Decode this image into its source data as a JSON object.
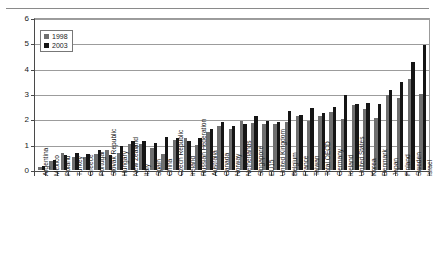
{
  "chart_data": {
    "type": "bar",
    "title": "",
    "xlabel": "",
    "ylabel": "",
    "ylim": [
      0,
      6
    ],
    "yticks": [
      0,
      1,
      2,
      3,
      4,
      5,
      6
    ],
    "grid": true,
    "legend_position": "top-left",
    "categories": [
      "Argentina",
      "Mexico",
      "Poland",
      "Turkey",
      "Greece",
      "Portugal",
      "Slovak Republic",
      "Hungary",
      "New Zealand",
      "Italy",
      "Spain",
      "China",
      "Czech Republic",
      "Ireland",
      "Russian Federation",
      "Australia",
      "Canada",
      "Norway",
      "Netherlands",
      "Singapore",
      "EU15",
      "United Kingdom",
      "Belgium",
      "France",
      "Taiwan",
      "Total OECD",
      "Germany",
      "Iceland",
      "United States",
      "Korea",
      "Denmark",
      "Japan",
      "Finland",
      "Sweden",
      "Israel"
    ],
    "series": [
      {
        "name": "1998",
        "color": "#6f6f6f",
        "values": [
          0.12,
          0.35,
          0.68,
          0.5,
          0.5,
          0.63,
          0.8,
          0.68,
          1.02,
          1.04,
          0.87,
          0.65,
          1.18,
          1.25,
          0.97,
          1.5,
          1.72,
          1.62,
          1.92,
          1.85,
          1.8,
          1.8,
          1.88,
          2.15,
          1.95,
          2.15,
          2.28,
          2.0,
          2.55,
          2.4,
          2.05,
          2.95,
          2.85,
          3.6,
          3.0
        ]
      },
      {
        "name": "2003",
        "color": "#151515",
        "values": [
          0.14,
          0.4,
          0.58,
          0.66,
          0.62,
          0.78,
          0.58,
          0.95,
          1.16,
          1.14,
          1.05,
          1.31,
          1.26,
          1.15,
          1.28,
          1.62,
          1.91,
          1.75,
          1.8,
          2.15,
          1.93,
          1.88,
          2.33,
          2.19,
          2.45,
          2.26,
          2.5,
          2.95,
          2.6,
          2.64,
          2.6,
          3.15,
          3.49,
          4.27,
          4.93
        ]
      }
    ]
  },
  "legend": {
    "items": [
      {
        "label": "1998",
        "key": "y1998"
      },
      {
        "label": "2003",
        "key": "y2003"
      }
    ]
  }
}
